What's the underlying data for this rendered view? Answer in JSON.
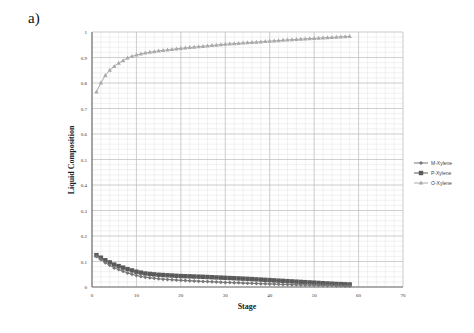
{
  "panel_label": "a)",
  "chart_data": {
    "type": "line",
    "title": "",
    "xlabel": "Stage",
    "ylabel": "Liquid Composition",
    "xlim": [
      0,
      70
    ],
    "ylim": [
      0,
      1
    ],
    "xticks": [
      0,
      10,
      20,
      30,
      40,
      50,
      60,
      70
    ],
    "yticks": [
      0,
      0.1,
      0.2,
      0.3,
      0.4,
      0.5,
      0.6,
      0.7,
      0.8,
      0.9,
      1
    ],
    "grid": true,
    "legend_position": "right",
    "series": [
      {
        "name": "M-Xylene",
        "marker": "diamond",
        "color": "#777777",
        "x": [
          1,
          3,
          5,
          8,
          10,
          12,
          15,
          20,
          25,
          30,
          35,
          40,
          45,
          50,
          55,
          58
        ],
        "values": [
          0.12,
          0.095,
          0.075,
          0.055,
          0.045,
          0.038,
          0.032,
          0.026,
          0.022,
          0.018,
          0.015,
          0.012,
          0.009,
          0.007,
          0.005,
          0.004
        ]
      },
      {
        "name": "P-Xylene",
        "marker": "square",
        "color": "#5a5a5a",
        "x": [
          1,
          3,
          5,
          8,
          10,
          12,
          15,
          20,
          25,
          30,
          35,
          40,
          45,
          50,
          55,
          58
        ],
        "values": [
          0.125,
          0.105,
          0.088,
          0.07,
          0.06,
          0.053,
          0.048,
          0.043,
          0.04,
          0.036,
          0.032,
          0.027,
          0.022,
          0.017,
          0.012,
          0.01
        ]
      },
      {
        "name": "O-Xylene",
        "marker": "triangle",
        "color": "#aaaaaa",
        "x": [
          1,
          2,
          3,
          4,
          5,
          6,
          8,
          10,
          12,
          15,
          20,
          25,
          30,
          35,
          40,
          45,
          50,
          55,
          58
        ],
        "values": [
          0.765,
          0.8,
          0.83,
          0.85,
          0.865,
          0.878,
          0.898,
          0.91,
          0.918,
          0.926,
          0.936,
          0.944,
          0.952,
          0.958,
          0.964,
          0.97,
          0.975,
          0.98,
          0.983
        ]
      }
    ]
  }
}
